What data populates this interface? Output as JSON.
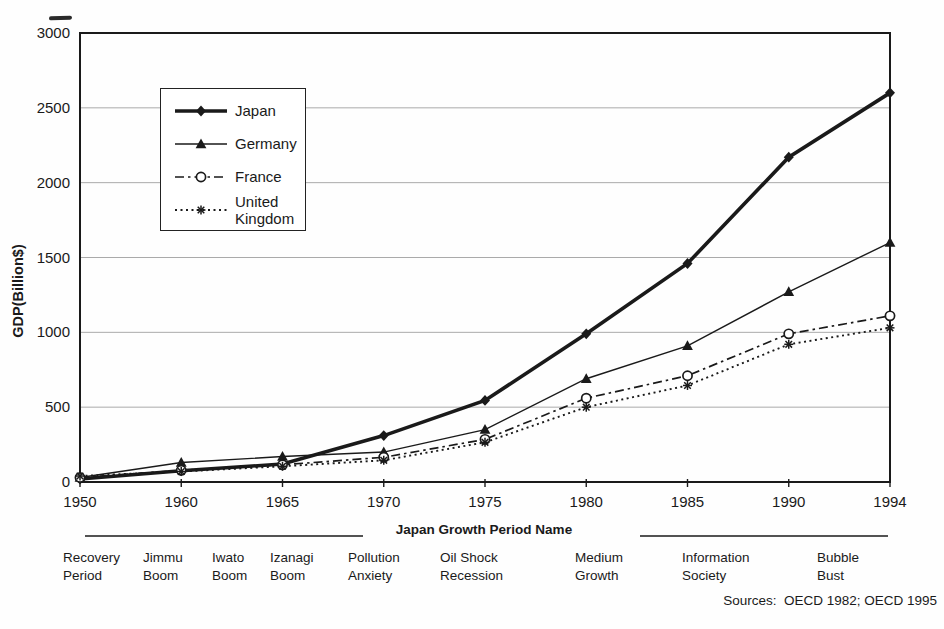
{
  "figure": {
    "sources_label": "Sources:  OECD 1982; OECD 1995"
  },
  "colors": {
    "ink": "#1a1a1a",
    "grid": "#aaaaaa",
    "background": "#fefefe"
  },
  "chart_data": {
    "type": "line",
    "title": "",
    "ylabel": "GDP(Billion$)",
    "xlabel": "Japan Growth Period Name",
    "ylim": [
      0,
      3000
    ],
    "yticks": [
      0,
      500,
      1000,
      1500,
      2000,
      2500,
      3000
    ],
    "grid": "horizontal",
    "legend_position": "upper-left-inside",
    "categories": [
      "1950",
      "1960",
      "1965",
      "1970",
      "1975",
      "1980",
      "1985",
      "1990",
      "1994"
    ],
    "series": [
      {
        "name": "Japan",
        "display_name": "Japan",
        "marker": "diamond-filled",
        "line": "solid-thick",
        "values": [
          20,
          75,
          120,
          310,
          545,
          990,
          1460,
          2170,
          2600
        ]
      },
      {
        "name": "Germany",
        "display_name": "Germany",
        "marker": "triangle-filled",
        "line": "solid-thin",
        "values": [
          30,
          130,
          170,
          200,
          350,
          690,
          910,
          1270,
          1600
        ]
      },
      {
        "name": "France",
        "display_name": "France",
        "marker": "circle-open",
        "line": "dash-dot",
        "values": [
          30,
          78,
          115,
          165,
          285,
          560,
          710,
          990,
          1110
        ]
      },
      {
        "name": "United Kingdom",
        "display_name": "United\nKingdom",
        "marker": "asterisk",
        "line": "dotted",
        "values": [
          40,
          70,
          105,
          145,
          265,
          500,
          645,
          920,
          1030
        ]
      }
    ],
    "growth_periods": {
      "underline_segments_px": [
        {
          "x1": 85,
          "x2": 363
        },
        {
          "x1": 640,
          "x2": 888
        }
      ],
      "labels": [
        {
          "text": "Recovery\nPeriod",
          "x": 63
        },
        {
          "text": "Jimmu\nBoom",
          "x": 143
        },
        {
          "text": "Iwato\nBoom",
          "x": 212
        },
        {
          "text": "Izanagi\nBoom",
          "x": 270
        },
        {
          "text": "Pollution\nAnxiety",
          "x": 348
        },
        {
          "text": "Oil Shock\nRecession",
          "x": 440
        },
        {
          "text": "Medium\nGrowth",
          "x": 575
        },
        {
          "text": "Information\nSociety",
          "x": 682
        },
        {
          "text": "Bubble\nBust",
          "x": 817
        }
      ]
    }
  }
}
